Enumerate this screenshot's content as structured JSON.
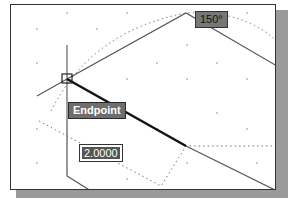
{
  "drawing": {
    "snap_tooltip": "Endpoint",
    "angle_tooltip": "150°",
    "length_input": "2.0000"
  },
  "colors": {
    "line": "#555555",
    "active_line": "#111111",
    "tooltip_bg": "#6e6e6e",
    "grid_dot": "#888888"
  }
}
